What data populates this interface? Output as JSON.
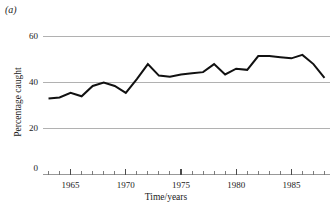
{
  "panel": {
    "label": "(a)"
  },
  "chart_data": {
    "type": "line",
    "title": "",
    "subtitle": "",
    "xlabel": "Time/years",
    "ylabel": "Percentage caught",
    "xlim": [
      1962.5,
      1988.5
    ],
    "ylim": [
      0,
      62
    ],
    "grid": true,
    "gridlines_y": [
      20,
      40,
      60
    ],
    "legend": "none",
    "yticks": [
      0,
      20,
      40,
      60
    ],
    "ytick_labels": [
      "0",
      "20",
      "40",
      "60"
    ],
    "xticks": [
      1965,
      1970,
      1975,
      1980,
      1985
    ],
    "xtick_labels": [
      "1965",
      "1970",
      "1975",
      "1980",
      "1985"
    ],
    "xticks_minor_start": 1963,
    "xticks_minor_end": 1988,
    "xticks_minor_step": 1,
    "x": [
      1963,
      1964,
      1965,
      1966,
      1967,
      1968,
      1969,
      1970,
      1971,
      1972,
      1973,
      1974,
      1975,
      1976,
      1977,
      1978,
      1979,
      1980,
      1981,
      1982,
      1983,
      1984,
      1985,
      1986,
      1987,
      1988
    ],
    "values": [
      33,
      33.5,
      35.5,
      34,
      38.5,
      40,
      38.5,
      35.5,
      41.5,
      48,
      43,
      42.5,
      43.5,
      44,
      44.5,
      48,
      43.5,
      46,
      45.5,
      51.5,
      51.5,
      51,
      50.5,
      52,
      48,
      42
    ],
    "series": [
      {
        "name": "Percentage caught",
        "color": "#111111",
        "values": [
          33,
          33.5,
          35.5,
          34,
          38.5,
          40,
          38.5,
          35.5,
          41.5,
          48,
          43,
          42.5,
          43.5,
          44,
          44.5,
          48,
          43.5,
          46,
          45.5,
          51.5,
          51.5,
          51,
          50.5,
          52,
          48,
          42
        ]
      }
    ]
  },
  "axis_label_positions": {
    "y_60": "60",
    "y_40": "40",
    "y_20": "20",
    "y_0": "0"
  }
}
